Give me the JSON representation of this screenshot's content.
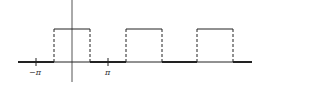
{
  "diagram": {
    "type": "square-wave",
    "axis": {
      "x": 72,
      "y_top": 0,
      "y_bottom": 82
    },
    "baseline": {
      "y": 62,
      "x_start": 18,
      "x_end": 252
    },
    "pulse_top_y": 29,
    "pulses": [
      {
        "x0": 54,
        "x1": 90
      },
      {
        "x0": 126,
        "x1": 162
      },
      {
        "x0": 197,
        "x1": 233
      }
    ],
    "ticks": [
      {
        "x": 36,
        "label": "−π"
      },
      {
        "x": 108,
        "label": "π"
      }
    ],
    "colors": {
      "line": "#222222",
      "axis": "#555555"
    }
  }
}
